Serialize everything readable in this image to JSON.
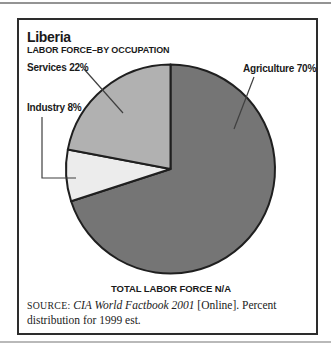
{
  "chart_data": {
    "type": "pie",
    "title": "Liberia",
    "subtitle": "LABOR FORCE–BY OCCUPATION",
    "slices": [
      {
        "label": "Agriculture",
        "value": 70,
        "display": "Agriculture 70%",
        "color": "#757575"
      },
      {
        "label": "Industry",
        "value": 8,
        "display": "Industry 8%",
        "color": "#ececec"
      },
      {
        "label": "Services",
        "value": 22,
        "display": "Services 22%",
        "color": "#b1b1b1"
      }
    ],
    "start_angle": "12 o'clock",
    "direction": "clockwise",
    "outline_color": "#1f1f1f",
    "total_note": "TOTAL LABOR FORCE N/A",
    "source": "SOURCE: CIA World Factbook 2001 [Online]. Percent distribution for 1999 est."
  },
  "source_note": {
    "label": "SOURCE:",
    "work": "CIA World Factbook 2001",
    "after": "[Online]. Percent distribution",
    "line2": "for 1999 est."
  }
}
